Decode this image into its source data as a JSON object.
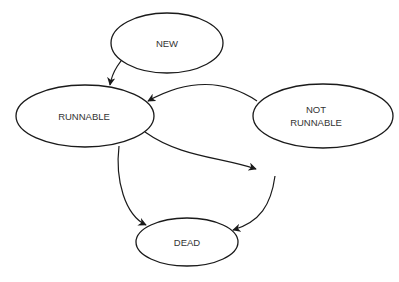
{
  "diagram": {
    "type": "state-diagram",
    "colors": {
      "stroke": "#1a1a1a",
      "text": "#333333",
      "background": "#ffffff"
    },
    "nodes": [
      {
        "id": "new",
        "label": "NEW"
      },
      {
        "id": "runnable",
        "label": "RUNNABLE"
      },
      {
        "id": "not_runnable",
        "label_line1": "NOT",
        "label_line2": "RUNNABLE"
      },
      {
        "id": "dead",
        "label": "DEAD"
      }
    ],
    "edges": [
      {
        "from": "new",
        "to": "runnable"
      },
      {
        "from": "not_runnable",
        "to": "runnable"
      },
      {
        "from": "runnable",
        "to": "not_runnable"
      },
      {
        "from": "runnable",
        "to": "dead"
      },
      {
        "from": "not_runnable",
        "to": "dead"
      }
    ]
  }
}
